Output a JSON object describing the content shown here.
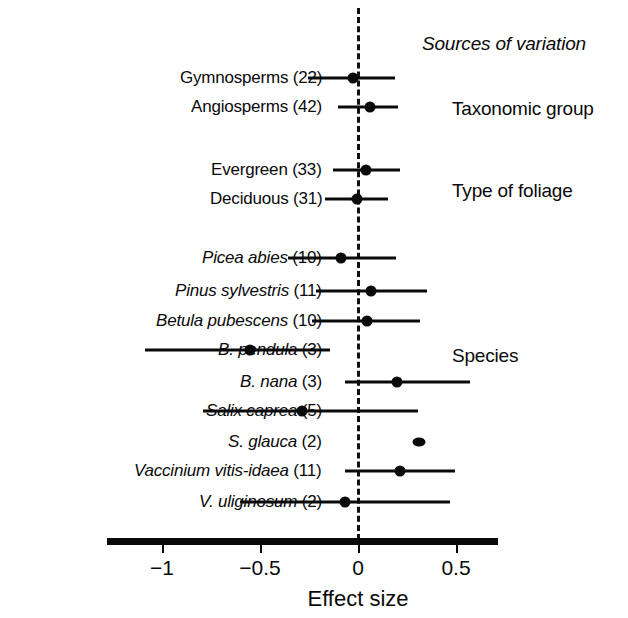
{
  "figure": {
    "header": "Sources of variation",
    "axis_title": "Effect size"
  },
  "groups": [
    {
      "label": "Taxonomic group"
    },
    {
      "label": "Type of foliage"
    },
    {
      "label": "Species"
    }
  ],
  "chart_data": {
    "type": "scatter",
    "title": "Sources of variation",
    "xlabel": "Effect size",
    "ylabel": "",
    "xlim": [
      -1.28,
      0.71
    ],
    "xticks": [
      -1,
      -0.5,
      0,
      0.5
    ],
    "xtick_labels": [
      "−1",
      "−0.5",
      "0",
      "0.5"
    ],
    "grid": false,
    "reference_line": 0,
    "legend": "none",
    "group_headings": [
      "Taxonomic group",
      "Type of foliage",
      "Species"
    ],
    "rows": [
      {
        "label": "Gymnosperms",
        "n": "22",
        "display": "Gymnosperms (22)",
        "italic": false,
        "group": "Taxonomic group",
        "effect": -0.025,
        "ci_low": -0.255,
        "ci_high": 0.19
      },
      {
        "label": "Angiosperms",
        "n": "42",
        "display": "Angiosperms (42)",
        "italic": false,
        "group": "Taxonomic group",
        "effect": 0.06,
        "ci_low": -0.1,
        "ci_high": 0.205
      },
      {
        "label": "Evergreen",
        "n": "33",
        "display": "Evergreen (33)",
        "italic": false,
        "group": "Type of foliage",
        "effect": 0.04,
        "ci_low": -0.13,
        "ci_high": 0.215
      },
      {
        "label": "Deciduous",
        "n": "31",
        "display": "Deciduous (31)",
        "italic": false,
        "group": "Type of foliage",
        "effect": -0.005,
        "ci_low": -0.17,
        "ci_high": 0.155
      },
      {
        "label": "Picea abies",
        "n": "10",
        "display": "Picea abies (10)",
        "italic": true,
        "group": "Species",
        "effect": -0.085,
        "ci_low": -0.355,
        "ci_high": 0.195
      },
      {
        "label": "Pinus sylvestris",
        "n": "11",
        "display": "Pinus sylvestris (11)",
        "italic": true,
        "group": "Species",
        "effect": 0.065,
        "ci_low": -0.215,
        "ci_high": 0.35
      },
      {
        "label": "Betula pubescens",
        "n": "10",
        "display": "Betula pubescens (10)",
        "italic": true,
        "group": "Species",
        "effect": 0.045,
        "ci_low": -0.235,
        "ci_high": 0.315
      },
      {
        "label": "B. pendula",
        "n": "3",
        "display": "B. pendula (3)",
        "italic": true,
        "group": "Species",
        "effect": -0.55,
        "ci_low": -1.085,
        "ci_high": -0.145
      },
      {
        "label": "B. nana",
        "n": "3",
        "display": "B. nana (3)",
        "italic": true,
        "group": "Species",
        "effect": 0.2,
        "ci_low": -0.065,
        "ci_high": 0.57
      },
      {
        "label": "Salix caprea",
        "n": "5",
        "display": "Salix caprea (5)",
        "italic": true,
        "group": "Species",
        "effect": -0.285,
        "ci_low": -0.79,
        "ci_high": 0.305
      },
      {
        "label": "S. glauca",
        "n": "2",
        "display": "S. glauca (2)",
        "italic": true,
        "group": "Species",
        "effect": 0.31,
        "ci_low": 0.28,
        "ci_high": 0.34
      },
      {
        "label": "Vaccinium vitis-idaea",
        "n": "11",
        "display": "Vaccinium vitis-idaea (11)",
        "italic": true,
        "group": "Species",
        "effect": 0.215,
        "ci_low": -0.065,
        "ci_high": 0.495
      },
      {
        "label": "V. uliginosum",
        "n": "2",
        "display": "V. uliginosum (2)",
        "italic": true,
        "group": "Species",
        "effect": -0.065,
        "ci_low": -0.6,
        "ci_high": 0.47
      }
    ]
  },
  "layout": {
    "row_y": [
      78,
      107,
      170,
      199,
      258,
      291,
      321,
      350,
      382,
      411,
      442,
      471,
      502
    ],
    "group_y": [
      98,
      180,
      345
    ],
    "header_y": 33,
    "label_right_x": 322,
    "group_x": 452,
    "axis_y": 538,
    "axis_x0": 107,
    "axis_x1": 498,
    "tick_label_y": 556,
    "axis_title_y": 586,
    "x_at_zero": 358,
    "px_per_unit": 196,
    "zero_line_top": 8,
    "zero_line_bottom": 540
  }
}
